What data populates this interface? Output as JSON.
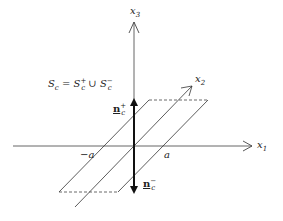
{
  "diagram": {
    "axes": {
      "x1": {
        "label": "x",
        "sub": "1"
      },
      "x2": {
        "label": "x",
        "sub": "2"
      },
      "x3": {
        "label": "x",
        "sub": "3"
      }
    },
    "equation": {
      "lhs": "S",
      "lhs_sub": "c",
      "eq": " = ",
      "t1": "S",
      "t1_sup": "+",
      "t1_sub": "c",
      "union": " ∪ ",
      "t2": "S",
      "t2_sup": "−",
      "t2_sub": "c"
    },
    "normals": {
      "plus": {
        "label": "n",
        "sub": "c",
        "sup": "+"
      },
      "minus": {
        "label": "n",
        "sub": "c",
        "sup": "−"
      }
    },
    "ticks": {
      "neg_a": "−a",
      "pos_a": "a"
    },
    "colors": {
      "line": "#333333",
      "dashed": "#444444"
    }
  }
}
